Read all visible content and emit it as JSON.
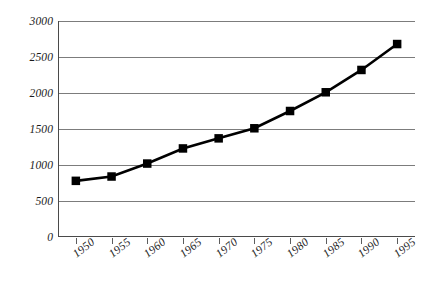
{
  "chart_data": {
    "type": "line",
    "title": "",
    "subtitle": "",
    "xlabel": "",
    "ylabel": "",
    "x": [
      1950,
      1955,
      1960,
      1965,
      1970,
      1975,
      1980,
      1985,
      1990,
      1995
    ],
    "categories": [
      "1950",
      "1955",
      "1960",
      "1965",
      "1970",
      "1975",
      "1980",
      "1985",
      "1990",
      "1995"
    ],
    "values": [
      780,
      840,
      1020,
      1230,
      1370,
      1510,
      1750,
      2010,
      2320,
      2680
    ],
    "series": [
      {
        "name": "",
        "values": [
          780,
          840,
          1020,
          1230,
          1370,
          1510,
          1750,
          2010,
          2320,
          2680
        ]
      }
    ],
    "xlim": [
      1947.5,
      1997.5
    ],
    "ylim": [
      0,
      3000
    ],
    "yticks": [
      0,
      500,
      1000,
      1500,
      2000,
      2500,
      3000
    ],
    "ytick_labels": [
      "0",
      "500",
      "1000",
      "1500",
      "2000",
      "2500",
      "3000"
    ],
    "xticks": [
      1950,
      1955,
      1960,
      1965,
      1970,
      1975,
      1980,
      1985,
      1990,
      1995
    ],
    "xtick_labels": [
      "1950",
      "1955",
      "1960",
      "1965",
      "1970",
      "1975",
      "1980",
      "1985",
      "1990",
      "1995"
    ],
    "grid": "horizontal",
    "legend": "none",
    "annotations": [],
    "style": {
      "line_color": "#000000",
      "marker": "square",
      "marker_color": "#000000",
      "grid_color": "#7c7c7c",
      "axis_color": "#4a4a4a",
      "background": "#ffffff"
    }
  }
}
